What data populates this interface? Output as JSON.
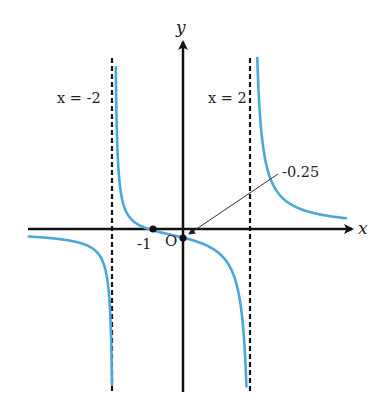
{
  "chart_data": {
    "type": "line",
    "title": "",
    "function": "y = (x + 1) / (x^2 - 4)",
    "xlabel": "x",
    "ylabel": "y",
    "origin_label": "O",
    "grid": false,
    "legend": null,
    "asymptotes": [
      {
        "type": "vertical",
        "x": -2,
        "label": "x = -2"
      },
      {
        "type": "vertical",
        "x": 2,
        "label": "x = 2"
      },
      {
        "type": "horizontal",
        "y": 0
      }
    ],
    "marked_points": [
      {
        "x": -1,
        "y": 0,
        "label": "-1"
      },
      {
        "x": 0,
        "y": -0.25,
        "label": "-0.25"
      }
    ],
    "annotations": [
      {
        "text": "-0.25",
        "points_to": [
          0,
          -0.25
        ]
      }
    ],
    "branches": [
      {
        "x_range": [
          -4.5,
          -2
        ],
        "behavior": "from ~-0.2 decreasing to -infinity"
      },
      {
        "x_range": [
          -2,
          2
        ],
        "behavior": "from +infinity decreasing through (-1,0) and (0,-0.25) to -infinity"
      },
      {
        "x_range": [
          2,
          4.8
        ],
        "behavior": "from +infinity decreasing toward 0+"
      }
    ],
    "xlim": [
      -4.5,
      4.9
    ],
    "ylim": [
      -4.8,
      5.3
    ],
    "curve_color": "#4aa8d8",
    "axis_color": "#111111"
  },
  "labels": {
    "x_axis": "x",
    "y_axis": "y",
    "origin": "O",
    "left_asymptote": "x = -2",
    "right_asymptote": "x = 2",
    "root": "-1",
    "intercept": "-0.25"
  }
}
